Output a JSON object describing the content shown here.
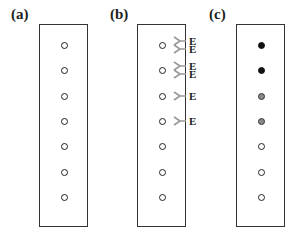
{
  "panels": [
    {
      "label": "(a)",
      "spots": [
        "open",
        "open",
        "open",
        "open",
        "open",
        "open",
        "open"
      ]
    },
    {
      "label": "(b)",
      "spots": [
        "open",
        "open",
        "open",
        "open",
        "open",
        "open",
        "open"
      ],
      "markers": [
        {
          "spot": 0,
          "labels": [
            "E",
            "E"
          ]
        },
        {
          "spot": 1,
          "labels": [
            "E",
            "E"
          ]
        },
        {
          "spot": 2,
          "labels": [
            "E"
          ]
        },
        {
          "spot": 3,
          "labels": [
            "E"
          ]
        }
      ]
    },
    {
      "label": "(c)",
      "spots": [
        "filled",
        "filled",
        "gray",
        "gray",
        "open",
        "open",
        "open"
      ]
    }
  ],
  "colors": {
    "outline": "#333333",
    "filled": "#111111",
    "gray": "#8a8a8a",
    "marker": "#999999"
  }
}
